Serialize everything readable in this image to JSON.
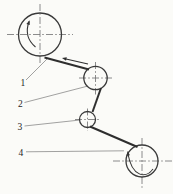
{
  "figure": {
    "kind": "mechanical-diagram",
    "background": "#fbfbf8",
    "line_color": "#3a3a3a",
    "web_color": "#2e2e2e",
    "centerline_color": "#6e6e6e",
    "leader_color": "#7a7a7a",
    "label_color": "#1f1f1f",
    "labels": [
      {
        "text": "1"
      },
      {
        "text": "2"
      },
      {
        "text": "3"
      },
      {
        "text": "4"
      }
    ],
    "arrows": {
      "web_direction": "toward-roller-1",
      "roller_1_rotation": "clockwise",
      "roller_4_rotation": "clockwise"
    }
  }
}
